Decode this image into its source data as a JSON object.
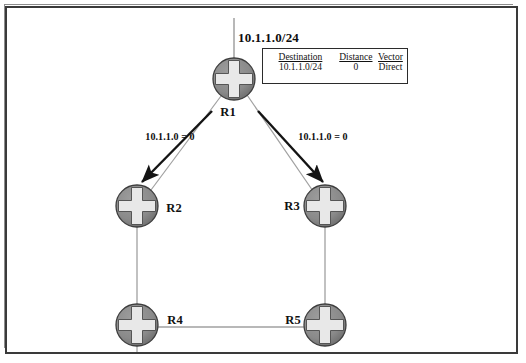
{
  "diagram": {
    "network_label": "10.1.1.0/24",
    "colors": {
      "node_fill": "#8a8a8a",
      "node_stroke": "#3d3d3d",
      "cross_fill": "#e8e8e8",
      "link_line": "#9a9a9a",
      "arrow": "#141414",
      "frame": "#3a3a3a",
      "text": "#111111"
    },
    "routing_table": {
      "headers": [
        "Destination",
        "Distance",
        "Vector"
      ],
      "rows": [
        {
          "destination": "10.1.1.0/24",
          "distance": "0",
          "vector": "Direct"
        }
      ]
    },
    "nodes": [
      {
        "id": "r1",
        "label": "R1",
        "x": 234,
        "y": 79,
        "label_x": 228,
        "label_y": 112
      },
      {
        "id": "r2",
        "label": "R2",
        "x": 137,
        "y": 206,
        "label_x": 174,
        "label_y": 208
      },
      {
        "id": "r3",
        "label": "R3",
        "x": 325,
        "y": 206,
        "label_x": 292,
        "label_y": 206
      },
      {
        "id": "r4",
        "label": "R4",
        "x": 137,
        "y": 325,
        "label_x": 175,
        "label_y": 320
      },
      {
        "id": "r5",
        "label": "R5",
        "x": 325,
        "y": 325,
        "label_x": 293,
        "label_y": 320
      }
    ],
    "updates": [
      {
        "id": "update-left",
        "text": "10.1.1.0 = 0",
        "label_x": 170,
        "label_y": 136
      },
      {
        "id": "update-right",
        "text": "10.1.1.0 = 0",
        "label_x": 323,
        "label_y": 136
      }
    ]
  }
}
